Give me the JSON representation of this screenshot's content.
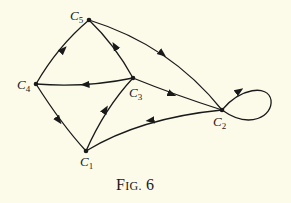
{
  "figure": {
    "caption_first": "F",
    "caption_rest": "IG.",
    "caption_number": "6"
  },
  "colors": {
    "background": "#fcfbea",
    "ink": "#1a1a1a"
  },
  "nodes": [
    {
      "id": "C1",
      "letter": "C",
      "sub": "1",
      "x": 86,
      "y": 151
    },
    {
      "id": "C2",
      "letter": "C",
      "sub": "2",
      "x": 222,
      "y": 110
    },
    {
      "id": "C3",
      "letter": "C",
      "sub": "3",
      "x": 133,
      "y": 78
    },
    {
      "id": "C4",
      "letter": "C",
      "sub": "4",
      "x": 36,
      "y": 84
    },
    {
      "id": "C5",
      "letter": "C",
      "sub": "5",
      "x": 89,
      "y": 20
    }
  ],
  "edges": [
    {
      "from": "C4",
      "to": "C5"
    },
    {
      "from": "C3",
      "to": "C5"
    },
    {
      "from": "C5",
      "to": "C2"
    },
    {
      "from": "C3",
      "to": "C4"
    },
    {
      "from": "C3",
      "to": "C2"
    },
    {
      "from": "C4",
      "to": "C1"
    },
    {
      "from": "C1",
      "to": "C3"
    },
    {
      "from": "C2",
      "to": "C1"
    },
    {
      "from": "C2",
      "to": "C2",
      "type": "self-loop"
    }
  ]
}
